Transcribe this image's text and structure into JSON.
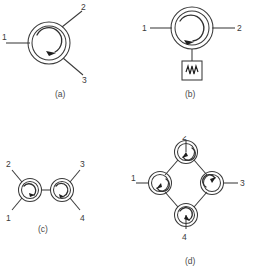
{
  "figure": {
    "background_color": "#ffffff",
    "line_color": "#3a3a3a",
    "arrow_color": "#1e1e1e",
    "text_color": "#3a3a3a"
  },
  "panels": [
    {
      "id": "a",
      "caption": "(a)",
      "description": "three-port circulator",
      "circulation": "clockwise",
      "ports": [
        {
          "label": "1",
          "direction": "west"
        },
        {
          "label": "2",
          "direction": "northeast"
        },
        {
          "label": "3",
          "direction": "southeast"
        }
      ],
      "terminations": []
    },
    {
      "id": "b",
      "caption": "(b)",
      "description": "three-port circulator with matched load on port 3",
      "circulation": "clockwise",
      "ports": [
        {
          "label": "1",
          "direction": "west"
        },
        {
          "label": "2",
          "direction": "east"
        }
      ],
      "terminations": [
        {
          "symbol": "resistor",
          "icon": "resistor-zigzag-icon",
          "direction": "south"
        }
      ]
    },
    {
      "id": "c",
      "caption": "(c)",
      "description": "two cascaded circulators forming a four-port network",
      "circulation": "clockwise",
      "ports": [
        {
          "label": "2",
          "direction": "northwest"
        },
        {
          "label": "1",
          "direction": "southwest"
        },
        {
          "label": "3",
          "direction": "northeast"
        },
        {
          "label": "4",
          "direction": "southeast"
        }
      ],
      "terminations": [],
      "circulator_count": 2
    },
    {
      "id": "d",
      "caption": "(d)",
      "description": "four circulators in a ring (diamond) forming a four-port network",
      "circulation": "clockwise",
      "ports": [
        {
          "label": "2",
          "direction": "north"
        },
        {
          "label": "1",
          "direction": "west"
        },
        {
          "label": "3",
          "direction": "east"
        },
        {
          "label": "4",
          "direction": "south"
        }
      ],
      "terminations": [],
      "circulator_count": 4
    }
  ]
}
